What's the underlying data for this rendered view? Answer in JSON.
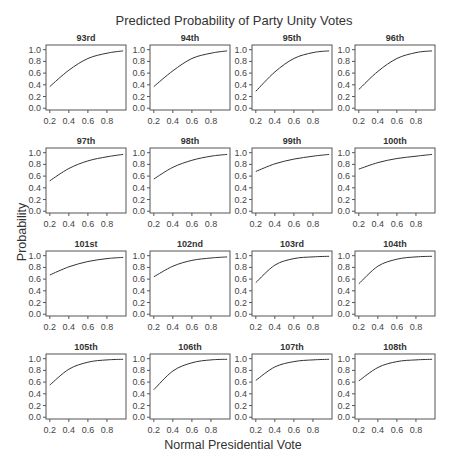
{
  "chart_data": {
    "type": "line",
    "title": "Predicted Probability of Party Unity Votes",
    "xlabel": "Normal Presidential Vote",
    "ylabel": "Probability",
    "layout": {
      "rows": 4,
      "cols": 4,
      "grid": false,
      "legend": "none"
    },
    "xlim": [
      0.16,
      1.0
    ],
    "ylim": [
      -0.03,
      1.08
    ],
    "x_ticks": [
      0.2,
      0.4,
      0.6,
      0.8
    ],
    "x_tick_labels": [
      "0.2",
      "0.4",
      "0.6",
      "0.8"
    ],
    "y_ticks": [
      0.0,
      0.2,
      0.4,
      0.6,
      0.8,
      1.0
    ],
    "y_tick_labels": [
      "0.0",
      "0.2",
      "0.4",
      "0.6",
      "0.8",
      "1.0"
    ],
    "x": [
      0.2,
      0.4,
      0.6,
      0.8,
      0.97
    ],
    "panels": [
      {
        "title": "93rd",
        "values": [
          0.37,
          0.65,
          0.85,
          0.94,
          0.98
        ]
      },
      {
        "title": "94th",
        "values": [
          0.37,
          0.64,
          0.85,
          0.94,
          0.98
        ]
      },
      {
        "title": "95th",
        "values": [
          0.29,
          0.62,
          0.85,
          0.95,
          0.98
        ]
      },
      {
        "title": "96th",
        "values": [
          0.32,
          0.63,
          0.85,
          0.95,
          0.98
        ]
      },
      {
        "title": "97th",
        "values": [
          0.52,
          0.73,
          0.86,
          0.93,
          0.97
        ]
      },
      {
        "title": "98th",
        "values": [
          0.55,
          0.75,
          0.87,
          0.94,
          0.97
        ]
      },
      {
        "title": "99th",
        "values": [
          0.68,
          0.81,
          0.89,
          0.94,
          0.97
        ]
      },
      {
        "title": "100th",
        "values": [
          0.72,
          0.83,
          0.9,
          0.94,
          0.97
        ]
      },
      {
        "title": "101st",
        "values": [
          0.67,
          0.81,
          0.9,
          0.95,
          0.97
        ]
      },
      {
        "title": "102nd",
        "values": [
          0.64,
          0.82,
          0.92,
          0.96,
          0.98
        ]
      },
      {
        "title": "103rd",
        "values": [
          0.54,
          0.84,
          0.95,
          0.98,
          0.99
        ]
      },
      {
        "title": "104th",
        "values": [
          0.52,
          0.82,
          0.94,
          0.98,
          0.99
        ]
      },
      {
        "title": "105th",
        "values": [
          0.55,
          0.82,
          0.94,
          0.98,
          0.99
        ]
      },
      {
        "title": "106th",
        "values": [
          0.47,
          0.79,
          0.93,
          0.98,
          0.99
        ]
      },
      {
        "title": "107th",
        "values": [
          0.63,
          0.86,
          0.95,
          0.98,
          0.99
        ]
      },
      {
        "title": "108th",
        "values": [
          0.62,
          0.85,
          0.95,
          0.98,
          0.99
        ]
      }
    ]
  }
}
